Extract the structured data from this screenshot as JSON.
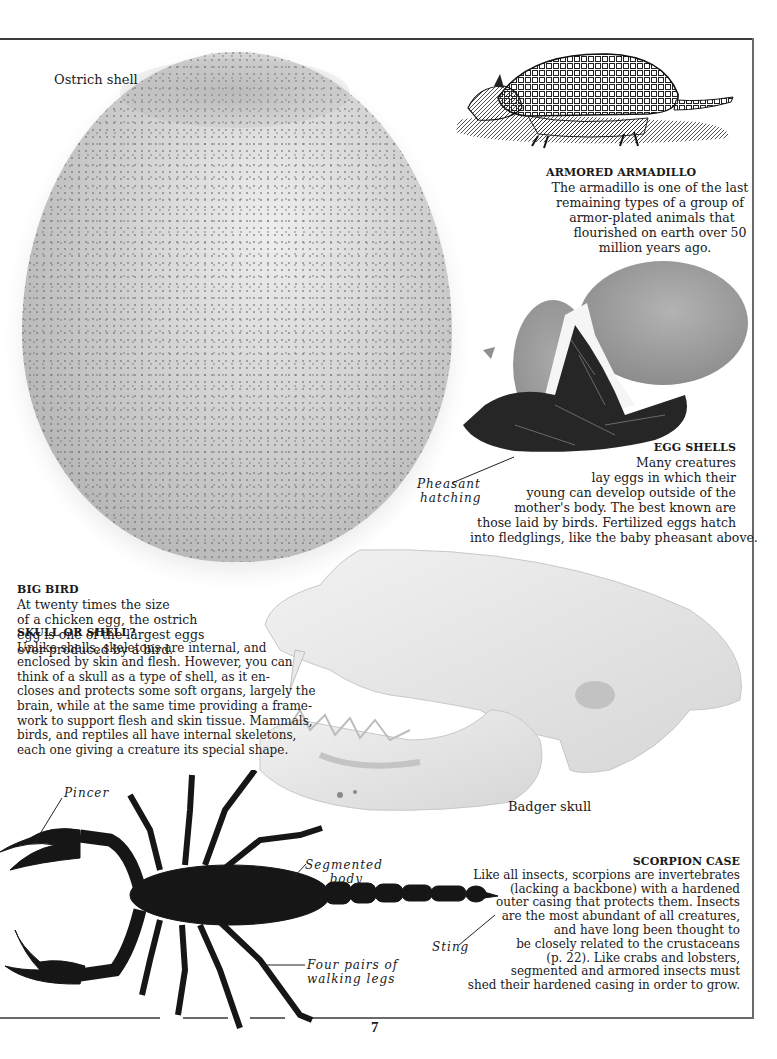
{
  "page": {
    "number": "7",
    "frame_color": "#3a3a3a"
  },
  "ostrich": {
    "label": "Ostrich shell",
    "caption": {
      "heading": "BIG BIRD",
      "lines": [
        "At twenty times the size",
        "of a chicken egg, the ostrich",
        "egg is one of the largest eggs",
        "ever produced by a bird."
      ]
    }
  },
  "armadillo": {
    "caption": {
      "heading": "ARMORED ARMADILLO",
      "lines": [
        "The armadillo is one of the last",
        "remaining types of a group of",
        "armor-plated animals that",
        "flourished on earth over 50",
        "million years ago."
      ]
    }
  },
  "egg_shells": {
    "pointer_label": [
      "Pheasant",
      "hatching"
    ],
    "caption": {
      "heading": "EGG SHELLS",
      "lines": [
        "Many creatures",
        "lay eggs in which their",
        "young can develop outside of the",
        "mother's body. The best known are",
        "those laid by birds. Fertilized eggs hatch",
        "into fledglings, like the baby pheasant above."
      ]
    }
  },
  "skull": {
    "label": "Badger skull",
    "caption": {
      "heading": "SKULL OR SHELL?",
      "lines": [
        "Unlike shells, skeletons are internal, and",
        "enclosed by skin and flesh.  However, you can",
        "think of a skull as a type of shell, as it en-",
        "closes and protects some soft organs, largely the",
        "brain, while at the same time providing a frame-",
        "work to support flesh and skin tissue.  Mammals,",
        "birds, and reptiles all have internal skeletons,",
        "each one giving a creature its special shape."
      ]
    }
  },
  "scorpion": {
    "labels": {
      "pincer": "Pincer",
      "segmented_body": [
        "Segmented",
        "body"
      ],
      "sting": "Sting",
      "legs": [
        "Four pairs of",
        "walking  legs"
      ]
    },
    "caption": {
      "heading": "SCORPION CASE",
      "lines": [
        "Like all insects, scorpions are invertebrates",
        "(lacking a backbone) with a hardened",
        "outer casing that protects them. Insects",
        "are the most abundant of all creatures,",
        "and have long been thought to",
        "be closely related to the crustaceans",
        "(p. 22). Like crabs and lobsters,",
        "segmented and armored insects must",
        "shed their hardened casing in order to grow."
      ]
    }
  }
}
